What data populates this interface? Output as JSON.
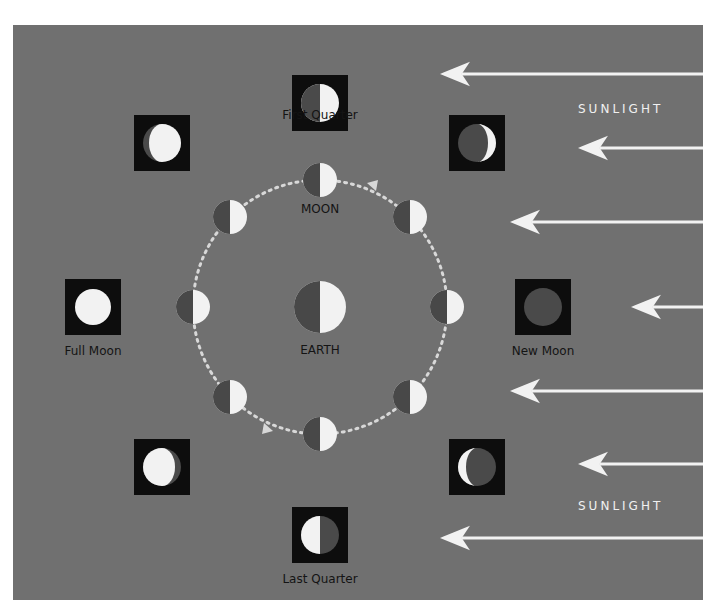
{
  "diagram": {
    "colors": {
      "background": "#707070",
      "panel": "#0d0d0d",
      "lit": "#f2f2f2",
      "dark": "#4a4a4a",
      "arrow": "#f2f2f2",
      "orbit": "#d8d8d8",
      "label": "#141414",
      "sun_label": "#eeeeee"
    },
    "center": {
      "label": "EARTH"
    },
    "orbit": {
      "label": "MOON",
      "direction": "counterclockwise"
    },
    "sunlight": {
      "label_top": "SUNLIGHT",
      "label_bottom": "SUNLIGHT",
      "direction": "from right"
    },
    "phases": [
      {
        "name": "First Quarter",
        "position": "top"
      },
      {
        "name": "Waxing Gibbous",
        "position": "top-left",
        "labeled": false
      },
      {
        "name": "Waxing Crescent",
        "position": "top-right",
        "labeled": false
      },
      {
        "name": "Full Moon",
        "position": "left"
      },
      {
        "name": "New Moon",
        "position": "right"
      },
      {
        "name": "Waning Gibbous",
        "position": "bottom-left",
        "labeled": false
      },
      {
        "name": "Waning Crescent",
        "position": "bottom-right",
        "labeled": false
      },
      {
        "name": "Last Quarter",
        "position": "bottom"
      }
    ]
  }
}
